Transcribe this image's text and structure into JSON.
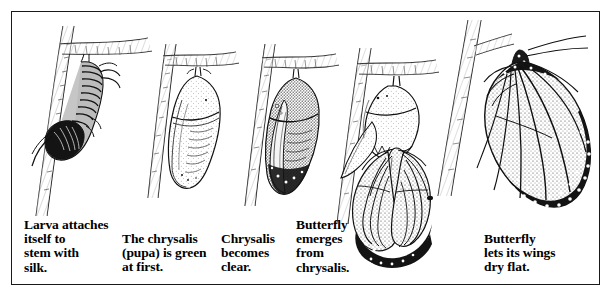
{
  "figure": {
    "border_color": "#1a1a1a",
    "background_color": "#ffffff",
    "ink_color": "#000000",
    "panel_count": 5
  },
  "panels": [
    {
      "index": 1,
      "stage": "larva-attaches",
      "subject": "caterpillar-hanging-j-shape",
      "caption": "Larva attaches\nitself to\nstem with\nsilk.",
      "caption_lines": [
        "Larva attaches",
        "itself to",
        "stem with",
        "silk."
      ]
    },
    {
      "index": 2,
      "stage": "chrysalis-green",
      "subject": "pale-smooth-chrysalis",
      "caption": "The chrysalis\n(pupa) is green\nat first.",
      "caption_lines": [
        "The chrysalis",
        "(pupa) is green",
        "at first."
      ]
    },
    {
      "index": 3,
      "stage": "chrysalis-clear",
      "subject": "darkened-transparent-chrysalis",
      "caption": "Chrysalis\nbecomes\nclear.",
      "caption_lines": [
        "Chrysalis",
        "becomes",
        "clear."
      ]
    },
    {
      "index": 4,
      "stage": "butterfly-emerges",
      "subject": "butterfly-emerging-from-split-chrysalis",
      "caption": "Butterfly\nemerges\nfrom\nchrysalis.",
      "caption_lines": [
        "Butterfly",
        "emerges",
        "from",
        "chrysalis."
      ]
    },
    {
      "index": 5,
      "stage": "wings-dry",
      "subject": "monarch-butterfly-wings-spread",
      "caption": "Butterfly\nlets its wings\ndry flat.",
      "caption_lines": [
        "Butterfly",
        "lets its wings",
        "dry flat."
      ]
    }
  ]
}
